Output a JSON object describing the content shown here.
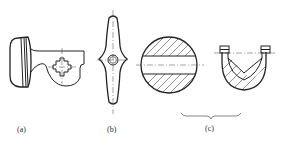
{
  "figure": {
    "panels": [
      {
        "id": "a",
        "label": "(a)",
        "subject": "handle with square-hole boss (removed section)"
      },
      {
        "id": "b",
        "label": "(b)",
        "subject": "two-armed lever with round hole, symmetric about centerline"
      },
      {
        "id": "c",
        "label": "(c)",
        "subject": "circular cross-section with hatched segments and U-shaped section with hatching",
        "grouped_by_brace": true
      }
    ],
    "colors": {
      "line": "#222222",
      "background": "#ffffff"
    }
  }
}
